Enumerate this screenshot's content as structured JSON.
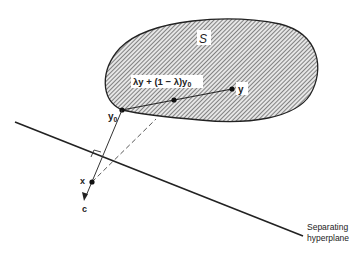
{
  "figure": {
    "set_label": "S",
    "point_y_label": "y",
    "point_y0_label": "y",
    "point_y0_subscript": "0",
    "combination_label": "λy + (1 − λ)y",
    "combination_subscript": "0",
    "point_x_label": "x",
    "vector_c_label": "c",
    "hyperplane_label_line1": "Separating",
    "hyperplane_label_line2": "hyperplane"
  },
  "colors": {
    "stroke": "#222222",
    "hatch": "#555555",
    "background": "#ffffff"
  }
}
